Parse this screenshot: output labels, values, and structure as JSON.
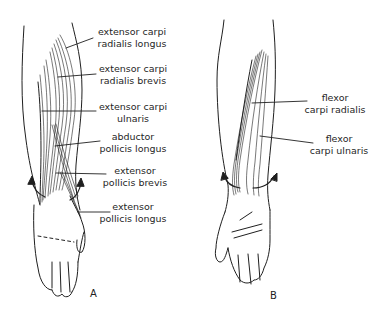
{
  "figure": {
    "panels": [
      {
        "id": "A",
        "letter": "A",
        "view": "posterior forearm and hand",
        "labels": [
          {
            "line1": "extensor carpi",
            "line2": "radialis longus"
          },
          {
            "line1": "extensor carpi",
            "line2": "radialis brevis"
          },
          {
            "line1": "extensor carpi",
            "line2": "ulnaris"
          },
          {
            "line1": "abductor",
            "line2": "pollicis longus"
          },
          {
            "line1": "extensor",
            "line2": "pollicis brevis"
          },
          {
            "line1": "extensor",
            "line2": "pollicis longus"
          }
        ]
      },
      {
        "id": "B",
        "letter": "B",
        "view": "anterior forearm and hand",
        "labels": [
          {
            "line1": "flexor",
            "line2": "carpi radialis"
          },
          {
            "line1": "flexor",
            "line2": "carpi ulnaris"
          }
        ]
      }
    ],
    "colors": {
      "ink": "#1f1f1f",
      "background": "#ffffff"
    }
  }
}
